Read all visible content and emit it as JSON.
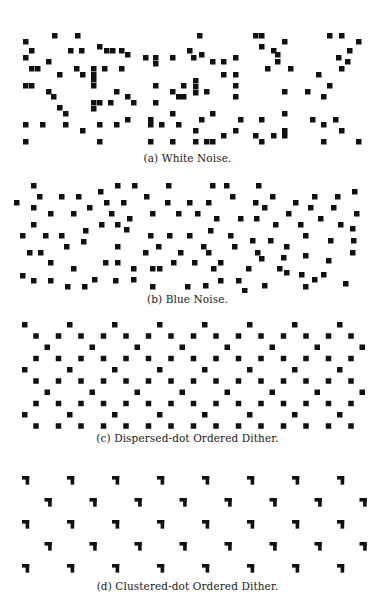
{
  "figure": {
    "dot_color": "#111111",
    "background": "#ffffff",
    "dot_size": 5.5,
    "panels": [
      {
        "id": "a",
        "caption": "(a) White Noise.",
        "top": 30,
        "height": 120,
        "caption_top": 152,
        "type": "points",
        "points": [
          [
            23,
            9
          ],
          [
            52,
            3
          ],
          [
            75,
            3
          ],
          [
            197,
            3
          ],
          [
            253,
            3
          ],
          [
            259,
            3
          ],
          [
            327,
            3
          ],
          [
            339,
            3
          ],
          [
            23,
            25
          ],
          [
            29,
            18
          ],
          [
            68,
            18
          ],
          [
            79,
            18
          ],
          [
            97,
            14
          ],
          [
            104,
            18
          ],
          [
            110,
            18
          ],
          [
            119,
            18
          ],
          [
            125,
            22
          ],
          [
            143,
            25
          ],
          [
            153,
            25
          ],
          [
            170,
            25
          ],
          [
            187,
            18
          ],
          [
            191,
            25
          ],
          [
            199,
            22
          ],
          [
            210,
            29
          ],
          [
            221,
            29
          ],
          [
            233,
            25
          ],
          [
            259,
            14
          ],
          [
            271,
            18
          ],
          [
            275,
            22
          ],
          [
            275,
            29
          ],
          [
            282,
            9
          ],
          [
            336,
            25
          ],
          [
            347,
            18
          ],
          [
            356,
            9
          ],
          [
            29,
            36
          ],
          [
            35,
            36
          ],
          [
            46,
            29
          ],
          [
            57,
            42
          ],
          [
            74,
            36
          ],
          [
            80,
            42
          ],
          [
            91,
            36
          ],
          [
            91,
            42
          ],
          [
            91,
            47
          ],
          [
            102,
            36
          ],
          [
            119,
            36
          ],
          [
            153,
            31
          ],
          [
            221,
            42
          ],
          [
            233,
            42
          ],
          [
            265,
            36
          ],
          [
            288,
            36
          ],
          [
            316,
            42
          ],
          [
            339,
            36
          ],
          [
            345,
            29
          ],
          [
            23,
            53
          ],
          [
            29,
            53
          ],
          [
            46,
            59
          ],
          [
            51,
            64
          ],
          [
            91,
            53
          ],
          [
            114,
            59
          ],
          [
            125,
            64
          ],
          [
            153,
            53
          ],
          [
            170,
            59
          ],
          [
            181,
            53
          ],
          [
            193,
            48
          ],
          [
            193,
            54
          ],
          [
            193,
            60
          ],
          [
            204,
            59
          ],
          [
            233,
            53
          ],
          [
            282,
            59
          ],
          [
            305,
            59
          ],
          [
            327,
            53
          ],
          [
            321,
            64
          ],
          [
            57,
            75
          ],
          [
            63,
            81
          ],
          [
            91,
            70
          ],
          [
            91,
            76
          ],
          [
            97,
            70
          ],
          [
            108,
            70
          ],
          [
            131,
            70
          ],
          [
            153,
            70
          ],
          [
            176,
            64
          ],
          [
            181,
            64
          ],
          [
            170,
            81
          ],
          [
            233,
            64
          ],
          [
            23,
            92
          ],
          [
            40,
            92
          ],
          [
            63,
            92
          ],
          [
            80,
            98
          ],
          [
            97,
            92
          ],
          [
            114,
            92
          ],
          [
            125,
            87
          ],
          [
            148,
            87
          ],
          [
            148,
            92
          ],
          [
            159,
            92
          ],
          [
            176,
            92
          ],
          [
            193,
            98
          ],
          [
            199,
            87
          ],
          [
            210,
            81
          ],
          [
            238,
            87
          ],
          [
            259,
            87
          ],
          [
            282,
            81
          ],
          [
            310,
            87
          ],
          [
            321,
            92
          ],
          [
            333,
            87
          ],
          [
            23,
            109
          ],
          [
            97,
            109
          ],
          [
            148,
            109
          ],
          [
            170,
            109
          ],
          [
            193,
            109
          ],
          [
            204,
            109
          ],
          [
            210,
            109
          ],
          [
            221,
            103
          ],
          [
            233,
            98
          ],
          [
            253,
            103
          ],
          [
            259,
            109
          ],
          [
            271,
            103
          ],
          [
            282,
            98
          ],
          [
            282,
            103
          ],
          [
            321,
            109
          ],
          [
            339,
            98
          ],
          [
            356,
            109
          ]
        ]
      },
      {
        "id": "b",
        "caption": "(b) Blue Noise.",
        "top": 178,
        "height": 115,
        "caption_top": 293,
        "type": "points",
        "points": [
          [
            31,
            5
          ],
          [
            115,
            5
          ],
          [
            132,
            5
          ],
          [
            166,
            5
          ],
          [
            210,
            5
          ],
          [
            224,
            5
          ],
          [
            256,
            5
          ],
          [
            270,
            16
          ],
          [
            312,
            16
          ],
          [
            335,
            16
          ],
          [
            14,
            22
          ],
          [
            37,
            16
          ],
          [
            59,
            16
          ],
          [
            76,
            16
          ],
          [
            98,
            11
          ],
          [
            104,
            22
          ],
          [
            121,
            22
          ],
          [
            144,
            16
          ],
          [
            165,
            22
          ],
          [
            187,
            22
          ],
          [
            206,
            22
          ],
          [
            230,
            16
          ],
          [
            253,
            22
          ],
          [
            262,
            27
          ],
          [
            286,
            33
          ],
          [
            293,
            22
          ],
          [
            308,
            27
          ],
          [
            331,
            27
          ],
          [
            352,
            11
          ],
          [
            354,
            33
          ],
          [
            31,
            27
          ],
          [
            48,
            33
          ],
          [
            71,
            33
          ],
          [
            87,
            27
          ],
          [
            109,
            33
          ],
          [
            127,
            38
          ],
          [
            150,
            33
          ],
          [
            176,
            33
          ],
          [
            195,
            33
          ],
          [
            214,
            38
          ],
          [
            238,
            38
          ],
          [
            254,
            38
          ],
          [
            273,
            44
          ],
          [
            298,
            44
          ],
          [
            318,
            38
          ],
          [
            338,
            44
          ],
          [
            350,
            48
          ],
          [
            31,
            44
          ],
          [
            20,
            55
          ],
          [
            43,
            55
          ],
          [
            59,
            55
          ],
          [
            83,
            50
          ],
          [
            99,
            44
          ],
          [
            115,
            44
          ],
          [
            124,
            49
          ],
          [
            148,
            55
          ],
          [
            167,
            55
          ],
          [
            187,
            55
          ],
          [
            208,
            50
          ],
          [
            228,
            55
          ],
          [
            250,
            60
          ],
          [
            268,
            60
          ],
          [
            284,
            66
          ],
          [
            303,
            55
          ],
          [
            328,
            60
          ],
          [
            351,
            60
          ],
          [
            27,
            72
          ],
          [
            38,
            72
          ],
          [
            64,
            66
          ],
          [
            81,
            61
          ],
          [
            115,
            66
          ],
          [
            143,
            72
          ],
          [
            156,
            66
          ],
          [
            178,
            72
          ],
          [
            201,
            66
          ],
          [
            206,
            72
          ],
          [
            232,
            66
          ],
          [
            255,
            72
          ],
          [
            281,
            77
          ],
          [
            303,
            75
          ],
          [
            326,
            80
          ],
          [
            350,
            72
          ],
          [
            48,
            82
          ],
          [
            71,
            88
          ],
          [
            103,
            82
          ],
          [
            115,
            82
          ],
          [
            131,
            88
          ],
          [
            150,
            88
          ],
          [
            157,
            88
          ],
          [
            171,
            82
          ],
          [
            192,
            82
          ],
          [
            211,
            88
          ],
          [
            218,
            82
          ],
          [
            246,
            88
          ],
          [
            259,
            78
          ],
          [
            277,
            88
          ],
          [
            299,
            94
          ],
          [
            321,
            94
          ],
          [
            20,
            95
          ],
          [
            31,
            100
          ],
          [
            48,
            100
          ],
          [
            65,
            106
          ],
          [
            82,
            106
          ],
          [
            92,
            99
          ],
          [
            113,
            100
          ],
          [
            131,
            99
          ],
          [
            150,
            106
          ],
          [
            185,
            106
          ],
          [
            203,
            105
          ],
          [
            218,
            100
          ],
          [
            236,
            100
          ],
          [
            242,
            110
          ],
          [
            262,
            105
          ],
          [
            284,
            92
          ],
          [
            303,
            106
          ],
          [
            312,
            99
          ],
          [
            343,
            103
          ]
        ]
      },
      {
        "id": "c",
        "caption": "(c) Dispersed-dot Ordered Dither.",
        "top": 316,
        "height": 115,
        "caption_top": 432,
        "type": "dispersed_grid",
        "origin_x": 25,
        "origin_y": 6,
        "spacing": 11.25,
        "cols": 31,
        "rows": 10,
        "pattern": [
          [
            1,
            0,
            0,
            0,
            0,
            0,
            0,
            0,
            0,
            0,
            0,
            0
          ],
          [
            0,
            0,
            1,
            0,
            0,
            0,
            1,
            0,
            0,
            0,
            0,
            0
          ],
          [
            0,
            0,
            0,
            0,
            1,
            0,
            0,
            0,
            0,
            0,
            0,
            0
          ],
          [
            0,
            0,
            1,
            0,
            0,
            0,
            1,
            0,
            0,
            0,
            0,
            0
          ]
        ],
        "row_offsets": [
          {
            "row": 0,
            "xs_step": 45,
            "x0": 0
          },
          {
            "row": 1,
            "xs_step": 22.5,
            "x0": 11.25
          },
          {
            "row": 2,
            "xs_step": 45,
            "x0": 22.5
          },
          {
            "row": 3,
            "xs_step": 22.5,
            "x0": 11.25
          }
        ]
      },
      {
        "id": "d",
        "caption": "(d) Clustered-dot Ordered Dither.",
        "top": 468,
        "height": 110,
        "caption_top": 580,
        "type": "clustered_grid",
        "origin_x": 26,
        "origin_y": 8,
        "spacing_x": 45,
        "spacing_y": 22,
        "row_shift": 22.5,
        "cols": 8,
        "rows": 5,
        "cell": 3.6
      }
    ]
  }
}
